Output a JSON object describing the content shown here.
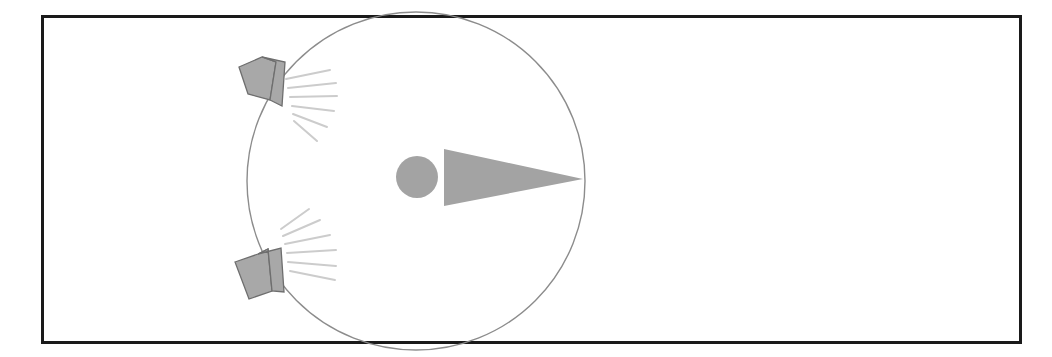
{
  "figure": {
    "title": "Stereo speaker placement and listening position diagram",
    "background_color": "#ffffff"
  },
  "frame": {
    "name": "outer-frame",
    "x": 41,
    "y": 15,
    "width": 981,
    "height": 329,
    "stroke_color": "#1a1a1a",
    "stroke_width": 3,
    "fill": "none"
  },
  "listening_circle": {
    "name": "listening-circle",
    "center_x": 416,
    "center_y": 181,
    "radius": 169,
    "stroke_color": "#8c8c8c",
    "stroke_width": 1.4,
    "fill": "none"
  },
  "listener": {
    "head": {
      "label": "listener-head",
      "center_x": 417,
      "center_y": 177,
      "radius": 21,
      "fill_color": "#a3a3a3"
    },
    "direction_cone": {
      "label": "listener-facing-cone",
      "points": "444,149 444,206 583,179",
      "fill_color": "#a3a3a3",
      "facing": "right"
    }
  },
  "speakers": [
    {
      "id": "speaker-top-left",
      "label": "Left speaker",
      "position": "upper-left arc",
      "fill_color": "#a8a8a8",
      "stroke_color": "#6e6e6e",
      "baffle_points": "239,67 262,57 276,62 270,100 248,94",
      "side_points": "262,57 285,62 282,106 270,100 276,62",
      "rays": [
        "286,79 330,70",
        "288,88 336,83",
        "290,97 337,96",
        "292,106 334,111",
        "293,114 327,127",
        "294,121 317,141"
      ],
      "ray_color": "#cccccc",
      "ray_width": 2
    },
    {
      "id": "speaker-bottom-left",
      "label": "Left-rear speaker",
      "position": "lower-left arc",
      "fill_color": "#a8a8a8",
      "stroke_color": "#6e6e6e",
      "baffle_points": "235,262 258,254 268,249 272,291 249,299",
      "side_points": "258,254 281,248 284,292 272,291 268,249",
      "rays": [
        "290,271 335,280",
        "288,262 336,266",
        "287,253 336,250",
        "285,244 330,235",
        "283,236 320,220",
        "281,229 309,209"
      ],
      "ray_color": "#cccccc",
      "ray_width": 2
    }
  ],
  "colors": {
    "frame_stroke": "#1a1a1a",
    "circle_stroke": "#8c8c8c",
    "shape_fill": "#a3a3a3",
    "ray": "#cccccc",
    "page_background": "#ffffff"
  }
}
